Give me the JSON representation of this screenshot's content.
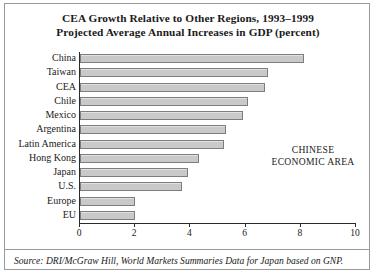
{
  "figure": {
    "title_lines": [
      "CEA Growth Relative to Other Regions, 1993–1999",
      "Projected Average Annual Increases in GDP (percent)"
    ],
    "annotation_lines": [
      "CHINESE",
      "ECONOMIC AREA"
    ],
    "source_note": "Source: DRI/McGraw Hill, World Markets Summaries Data for Japan based on GNP.",
    "bar_fill_color": "#c9c9c9",
    "bar_border_color": "#7d7d7d",
    "axis_color": "#2b2b2b",
    "frame_color": "#9a9a9a"
  },
  "chart_data": {
    "type": "bar",
    "orientation": "horizontal",
    "title": "CEA Growth Relative to Other Regions, 1993–1999 Projected Average Annual Increases in GDP (percent)",
    "xlabel": "",
    "ylabel": "",
    "xlim": [
      0,
      10
    ],
    "xticks": [
      0,
      2,
      4,
      6,
      8,
      10
    ],
    "xtick_labels": [
      "0",
      "2",
      "4",
      "6",
      "8",
      "10"
    ],
    "grid": false,
    "legend": false,
    "annotations": [
      "CHINESE ECONOMIC AREA"
    ],
    "categories": [
      "China",
      "Taiwan",
      "CEA",
      "Chile",
      "Mexico",
      "Argentina",
      "Latin America",
      "Hong Kong",
      "Japan",
      "U.S.",
      "Europe",
      "EU"
    ],
    "values": [
      8.1,
      6.8,
      6.7,
      6.1,
      5.9,
      5.3,
      5.2,
      4.3,
      3.9,
      3.7,
      2.0,
      2.0
    ]
  }
}
